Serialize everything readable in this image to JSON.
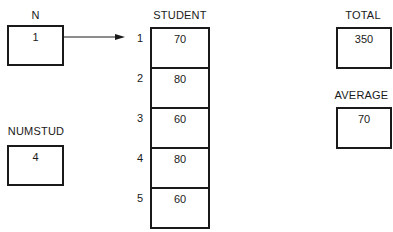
{
  "variables": {
    "n": {
      "label": "N",
      "value": "1"
    },
    "numstud": {
      "label": "NUMSTUD",
      "value": "4"
    },
    "total": {
      "label": "TOTAL",
      "value": "350"
    },
    "average": {
      "label": "AVERAGE",
      "value": "70"
    }
  },
  "student": {
    "label": "STUDENT",
    "indices": [
      "1",
      "2",
      "3",
      "4",
      "5"
    ],
    "values": [
      "70",
      "80",
      "60",
      "80",
      "60"
    ]
  },
  "pointer": {
    "from": "N",
    "to": "STUDENT[1]"
  }
}
